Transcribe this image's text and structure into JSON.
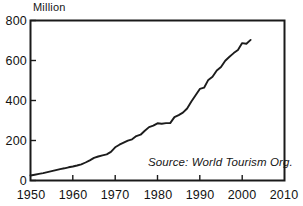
{
  "chart_data": {
    "type": "line",
    "title": "",
    "unit_label": "Million",
    "xlabel": "",
    "ylabel": "",
    "xlim": [
      1950,
      2010
    ],
    "ylim": [
      0,
      800
    ],
    "grid": false,
    "legend": false,
    "annotations": [
      {
        "name": "source-note",
        "text": "Source: World Tourism Org.",
        "x": 1988,
        "y": 60
      }
    ],
    "xticks": [
      1950,
      1960,
      1970,
      1980,
      1990,
      2000,
      2010
    ],
    "xticklabels": [
      "1950",
      "1960",
      "1970",
      "1980",
      "1990",
      "2000",
      "2010"
    ],
    "yticks": [
      0,
      200,
      400,
      600,
      800
    ],
    "yticklabels": [
      "0",
      "200",
      "400",
      "600",
      "800"
    ],
    "series": [
      {
        "name": "International tourist arrivals",
        "color": "#1c1c1c",
        "x": [
          1950,
          1951,
          1952,
          1953,
          1954,
          1955,
          1956,
          1957,
          1958,
          1959,
          1960,
          1961,
          1962,
          1963,
          1964,
          1965,
          1966,
          1967,
          1968,
          1969,
          1970,
          1971,
          1972,
          1973,
          1974,
          1975,
          1976,
          1977,
          1978,
          1979,
          1980,
          1981,
          1982,
          1983,
          1984,
          1985,
          1986,
          1987,
          1988,
          1989,
          1990,
          1991,
          1992,
          1993,
          1994,
          1995,
          1996,
          1997,
          1998,
          1999,
          2000,
          2001,
          2002
        ],
        "values": [
          25,
          29,
          33,
          37,
          42,
          47,
          52,
          57,
          61,
          66,
          70,
          75,
          81,
          90,
          101,
          113,
          120,
          126,
          131,
          143,
          166,
          179,
          189,
          199,
          206,
          222,
          229,
          249,
          267,
          274,
          286,
          284,
          287,
          287,
          317,
          327,
          339,
          360,
          395,
          426,
          458,
          464,
          503,
          519,
          550,
          567,
          599,
          619,
          637,
          652,
          687,
          684,
          703
        ]
      }
    ]
  }
}
